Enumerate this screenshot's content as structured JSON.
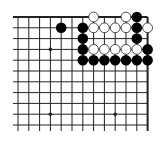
{
  "game": "go",
  "view": "top-right corner",
  "board": {
    "columns_visible": 13,
    "rows_visible": 11,
    "edges": [
      "top",
      "right"
    ],
    "background": "#ffffff",
    "line_color": "#222222",
    "star_points": [
      [
        3,
        3
      ],
      [
        3,
        9
      ],
      [
        9,
        9
      ]
    ]
  },
  "stones": {
    "black": [
      [
        4,
        1
      ],
      [
        11,
        0
      ],
      [
        6,
        1
      ],
      [
        11,
        1
      ],
      [
        6,
        2
      ],
      [
        11,
        2
      ],
      [
        6,
        3
      ],
      [
        12,
        3
      ],
      [
        6,
        4
      ],
      [
        7,
        4
      ],
      [
        8,
        4
      ],
      [
        9,
        4
      ],
      [
        10,
        4
      ],
      [
        11,
        4
      ],
      [
        12,
        4
      ]
    ],
    "white": [
      [
        7,
        0
      ],
      [
        10,
        0
      ],
      [
        7,
        1
      ],
      [
        8,
        1
      ],
      [
        9,
        1
      ],
      [
        10,
        1
      ],
      [
        12,
        1
      ],
      [
        7,
        3
      ],
      [
        8,
        3
      ],
      [
        9,
        3
      ],
      [
        10,
        3
      ],
      [
        11,
        3
      ]
    ]
  },
  "colors": {
    "black_stone": "#000000",
    "white_stone": "#ffffff",
    "white_stone_outline": "#222222"
  }
}
